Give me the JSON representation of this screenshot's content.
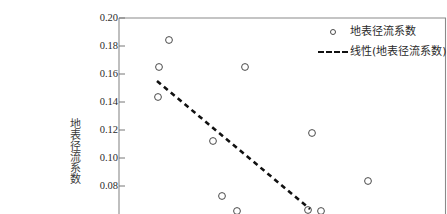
{
  "figure": {
    "top_strip_text": "                    ",
    "background_color": "#ffffff",
    "frame_color": "#8a8a8a"
  },
  "axis": {
    "y_title": "地表径流系数",
    "y_ticks": [
      "0.20",
      "0.18",
      "0.16",
      "0.14",
      "0.12",
      "0.10",
      "0.08"
    ],
    "y_tick_values": [
      0.2,
      0.18,
      0.16,
      0.14,
      0.12,
      0.1,
      0.08
    ],
    "y_min_visible": 0.064,
    "y_max_visible": 0.2,
    "x_title": "",
    "x_ticks": []
  },
  "legend": {
    "position": "top-right",
    "items": [
      {
        "label": "地表径流系数",
        "key": "open-circle-marker",
        "color": "#4a4a4a"
      },
      {
        "label": "线性(地表径流系数)",
        "key": "dashed-line",
        "color": "#111111"
      }
    ]
  },
  "chart_data": {
    "type": "scatter",
    "title": "",
    "xlabel": "",
    "ylabel": "地表径流系数",
    "ylim": [
      0.064,
      0.2
    ],
    "xlim": [
      0,
      1
    ],
    "grid": false,
    "legend_position": "top-right",
    "series": [
      {
        "name": "地表径流系数",
        "marker": "open-circle",
        "color": "#4a4a4a",
        "points": [
          {
            "px": 169,
            "py": 40,
            "x": 0.155,
            "y": 0.1835
          },
          {
            "px": 159,
            "py": 67,
            "x": 0.125,
            "y": 0.1643
          },
          {
            "px": 158,
            "py": 97,
            "x": 0.122,
            "y": 0.1429
          },
          {
            "px": 245,
            "py": 67,
            "x": 0.386,
            "y": 0.1657
          },
          {
            "px": 213,
            "py": 141,
            "x": 0.289,
            "y": 0.1114
          },
          {
            "px": 312,
            "py": 133,
            "x": 0.589,
            "y": 0.1207
          },
          {
            "px": 368,
            "py": 181,
            "x": 0.759,
            "y": 0.0864
          },
          {
            "px": 222,
            "py": 196,
            "x": 0.316,
            "y": 0.0757
          },
          {
            "px": 237,
            "py": 211,
            "x": 0.362,
            "y": 0.065
          },
          {
            "px": 308,
            "py": 210,
            "x": 0.577,
            "y": 0.0657
          },
          {
            "px": 321,
            "py": 211,
            "x": 0.617,
            "y": 0.065
          }
        ]
      }
    ],
    "trendline": {
      "name": "线性(地表径流系数)",
      "style": "dashed",
      "color": "#111111",
      "x1_px": 157,
      "y1_px": 81,
      "x2_px": 310,
      "y2_px": 209,
      "y_start": 0.1543,
      "y_end": 0.0629
    }
  }
}
